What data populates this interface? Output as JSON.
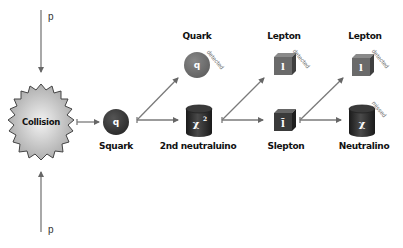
{
  "colors": {
    "arrow": "#777777",
    "dark_particle": "#2e2e2e",
    "gray_particle": "#6a6a6a",
    "collision_fill": "#c8c8c8",
    "label": "#111111"
  },
  "incoming": {
    "top_label": "p",
    "bottom_label": "p"
  },
  "collision": {
    "label": "Collision",
    "icon": "starburst-icon"
  },
  "nodes": {
    "squark": {
      "symbol": "q",
      "label": "Squark",
      "icon": "dark-sphere-icon"
    },
    "quark": {
      "symbol": "q",
      "label": "Quark",
      "status": "detected",
      "icon": "gray-sphere-icon"
    },
    "neutralino2": {
      "symbol": "χ",
      "superscript": "2",
      "label": "2nd neutraluino",
      "icon": "cylinder-icon"
    },
    "lepton1": {
      "symbol": "l",
      "label": "Lepton",
      "status": "detected",
      "icon": "gray-cube-icon"
    },
    "slepton": {
      "symbol": "l̃",
      "label": "Slepton",
      "icon": "dark-cube-icon"
    },
    "lepton2": {
      "symbol": "l",
      "label": "Lepton",
      "status": "detected",
      "icon": "gray-cube-icon"
    },
    "neutralino": {
      "symbol": "χ",
      "label": "Neutralino",
      "status": "missed",
      "icon": "cylinder-icon"
    }
  }
}
